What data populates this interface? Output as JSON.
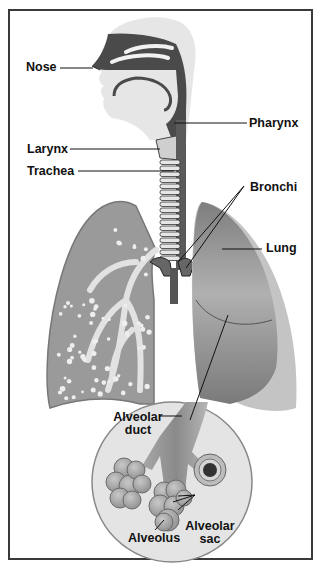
{
  "diagram": {
    "labels": {
      "nose": "Nose",
      "pharynx": "Pharynx",
      "larynx": "Larynx",
      "trachea": "Trachea",
      "bronchi": "Bronchi",
      "lung": "Lung",
      "alveolar_duct_line1": "Alveolar",
      "alveolar_duct_line2": "duct",
      "alveolar_sac_line1": "Alveolar",
      "alveolar_sac_line2": "sac",
      "alveolus": "Alveolus"
    },
    "colors": {
      "frame": "#3a3a3a",
      "airway_dark": "#4a4a4a",
      "head_light": "#e6e6e6",
      "lung_left_fill": "#9a9a9a",
      "lung_left_branch": "#e2e2e2",
      "lung_right_fill": "#8c8c8c",
      "lung_right_outer": "#c4c4c4",
      "inset_circle": "#e4e4e4",
      "alveoli": "#b8b8b8",
      "leader_line": "#111111"
    }
  }
}
